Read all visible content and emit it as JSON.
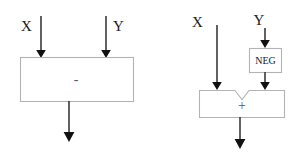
{
  "figure": {
    "title": "",
    "background_color": "#ffffff",
    "box_stroke_color": "#b3b3b3",
    "wire_color": "#3a3a3a",
    "arrowhead_color": "#111111",
    "label_color": "#1a1a1a",
    "operator_color": "#5a5a5a"
  },
  "diagrams": [
    {
      "id": "subtractor",
      "name": "subtraction-block-diagram",
      "inputs": [
        {
          "label": "X",
          "label_side": "left"
        },
        {
          "label": "Y",
          "label_side": "right"
        }
      ],
      "block": {
        "operator": "-",
        "shape": "rectangle"
      },
      "output": {
        "label": ""
      }
    },
    {
      "id": "adder-with-negate",
      "name": "addition-with-negate-block-diagram",
      "inputs": [
        {
          "label": "X",
          "label_side": "left"
        },
        {
          "label": "Y",
          "label_side": "center"
        }
      ],
      "negate_block": {
        "label": "NEG",
        "shape": "rectangle"
      },
      "block": {
        "operator": "+",
        "shape": "notched-rectangle"
      },
      "output": {
        "label": ""
      }
    }
  ]
}
